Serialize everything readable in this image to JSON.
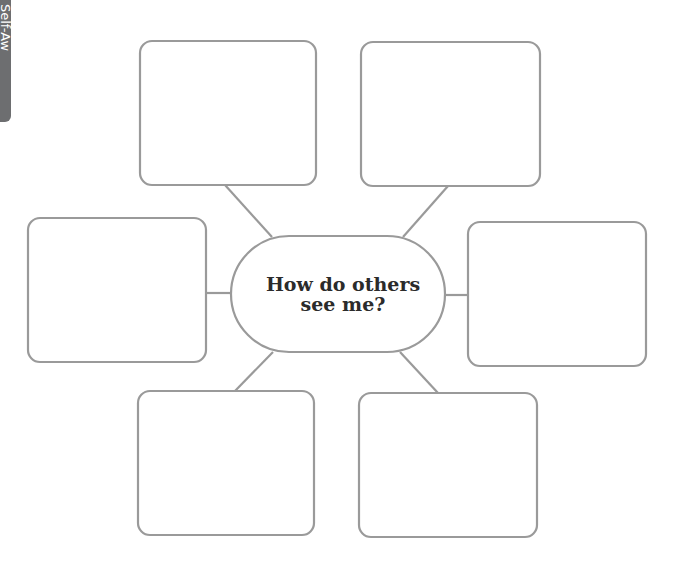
{
  "side_tab": {
    "label": "Self-Aw"
  },
  "center": {
    "line1": "How do others",
    "line2": "see me?"
  },
  "colors": {
    "stroke": "#9a9a9a",
    "tab": "#6d6e70",
    "text": "#2b2b2b"
  },
  "boxes": [
    {
      "id": "top-left",
      "text": ""
    },
    {
      "id": "top-right",
      "text": ""
    },
    {
      "id": "left",
      "text": ""
    },
    {
      "id": "right",
      "text": ""
    },
    {
      "id": "bottom-left",
      "text": ""
    },
    {
      "id": "bottom-right",
      "text": ""
    }
  ]
}
